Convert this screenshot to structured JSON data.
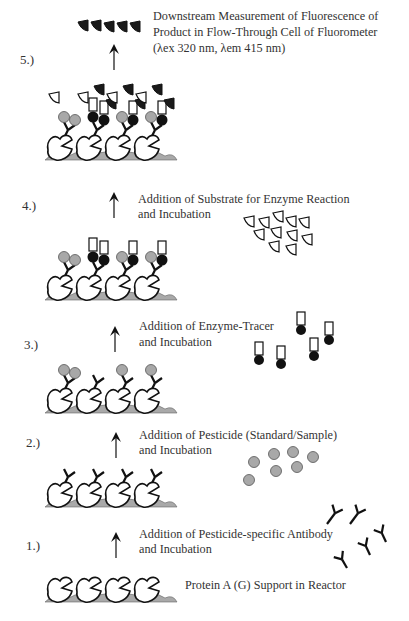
{
  "colors": {
    "ink": "#111111",
    "support": "#a9a9a9",
    "pesticide": "#a8a8a8",
    "enzyme": "#111111",
    "product": "#1a1a1a",
    "outline_fill": "#ffffff"
  },
  "steps": [
    {
      "number": "1.)",
      "lines": [
        "Addition of Pesticide-specific Antibody",
        "and Incubation"
      ],
      "free_species": "antibody",
      "free_count": 5
    },
    {
      "number": "2.)",
      "lines": [
        "Addition of Pesticide (Standard/Sample)",
        "and Incubation"
      ],
      "free_species": "pesticide",
      "free_count": 7
    },
    {
      "number": "3.)",
      "lines": [
        "Addition of Enzyme-Tracer",
        "and Incubation"
      ],
      "free_species": "enzyme-tracer",
      "free_count": 5
    },
    {
      "number": "4.)",
      "lines": [
        "Addition of Substrate for Enzyme Reaction",
        "and Incubation"
      ],
      "free_species": "substrate",
      "free_count": 12
    },
    {
      "number": "5.)",
      "lines": [
        "Downstream Measurement of Fluorescence of",
        "Product in Flow-Through Cell of Fluorometer",
        "(λex 320 nm, λem 415 nm)"
      ],
      "free_species": "product",
      "free_count": 5
    }
  ],
  "support_label": "Protein A (G) Support in Reactor",
  "legend_semantics": {
    "support": "protein-a-support",
    "antibody": "y-shaped antibody",
    "pesticide": "grey circle",
    "enzyme_tracer": "black circle with rectangle",
    "substrate": "open wedge",
    "product": "filled wedge"
  }
}
